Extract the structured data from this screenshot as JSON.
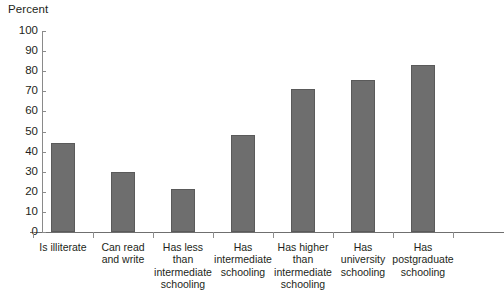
{
  "chart_data": {
    "type": "bar",
    "title": "",
    "axis_title": "Percent",
    "xlabel": "",
    "ylabel": "Percent",
    "ylim": [
      0,
      100
    ],
    "ytick_step": 10,
    "yticks": [
      "100",
      "90",
      "80",
      "70",
      "60",
      "50",
      "40",
      "30",
      "20",
      "10",
      "0"
    ],
    "grid": false,
    "legend": "none",
    "bar_color": "#6e6e6e",
    "bar_edge_color": "#5a5a5a",
    "axis_color": "#8a8a8a",
    "categories": [
      "Is illiterate",
      "Can read\nand write",
      "Has less\nthan\nintermediate\nschooling",
      "Has\nintermediate\nschooling",
      "Has  higher\nthan\nintermediate\nschooling",
      "Has\nuniversity\nschooling",
      "Has\npostgraduate\nschooling"
    ],
    "values": [
      44.5,
      30,
      21.5,
      48.5,
      71,
      75.5,
      83
    ]
  }
}
